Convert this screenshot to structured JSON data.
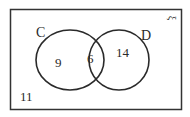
{
  "diagram": {
    "type": "venn",
    "universal_symbol": "ξ",
    "sets": [
      {
        "name": "C",
        "only": "9"
      },
      {
        "name": "D",
        "only": "14"
      }
    ],
    "intersection": "6",
    "outside": "11"
  },
  "colors": {
    "stroke": "#2a2a2a",
    "background": "#ffffff"
  }
}
